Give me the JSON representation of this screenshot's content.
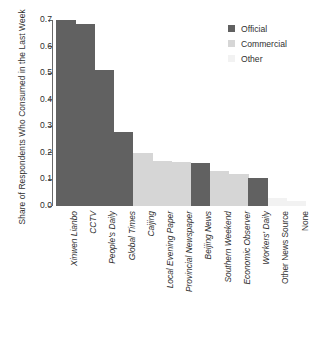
{
  "chart_data": {
    "type": "bar",
    "title": "",
    "xlabel": "",
    "ylabel": "Share of Respondents Who Consumed in the Last Week",
    "ylim": [
      0.0,
      0.7
    ],
    "ytick_labels": [
      "0.0",
      "0.1",
      "0.2",
      "0.3",
      "0.4",
      "0.5",
      "0.6",
      "0.7"
    ],
    "ytick_values": [
      0.0,
      0.1,
      0.2,
      0.3,
      0.4,
      0.5,
      0.6,
      0.7
    ],
    "grid": false,
    "legend_position": "top-right",
    "categories": [
      "Xinwen Lianbo",
      "CCTV",
      "People's Daily",
      "Global Times",
      "Caijing",
      "Local Evening Paper",
      "Provincial Newspaper",
      "Beijing News",
      "Southern Weekend",
      "Economic Observer",
      "Workers' Daily",
      "Other News Source",
      "None"
    ],
    "values": [
      0.7,
      0.685,
      0.513,
      0.279,
      0.199,
      0.17,
      0.165,
      0.163,
      0.13,
      0.122,
      0.107,
      0.03,
      0.02
    ],
    "groups": [
      "Official",
      "Official",
      "Official",
      "Official",
      "Commercial",
      "Commercial",
      "Commercial",
      "Official",
      "Commercial",
      "Commercial",
      "Official",
      "Other",
      "Other"
    ],
    "category_styles": [
      "italic",
      "italic",
      "italic",
      "italic",
      "italic",
      "italic",
      "italic",
      "italic",
      "italic",
      "italic",
      "italic",
      "upright",
      "upright"
    ],
    "legend": [
      {
        "label": "Official",
        "color": "#616161"
      },
      {
        "label": "Commercial",
        "color": "#d6d6d6"
      },
      {
        "label": "Other",
        "color": "#f2f2f2"
      }
    ],
    "colors": {
      "Official": "#616161",
      "Commercial": "#d6d6d6",
      "Other": "#f2f2f2",
      "axis": "#6a6a6a",
      "text": "#2f2f2f",
      "background": "#ffffff"
    }
  }
}
